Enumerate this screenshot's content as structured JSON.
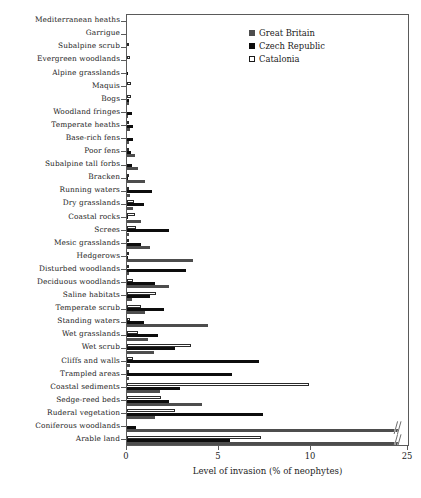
{
  "chart_data": {
    "type": "bar",
    "orientation": "horizontal",
    "title": "",
    "xlabel": "Level of invasion (% of neophytes)",
    "ylabel": "",
    "xlim": [
      0,
      25
    ],
    "xticks": [
      0,
      5,
      10,
      25
    ],
    "xtick_labels": [
      "0",
      "5",
      "10",
      "25"
    ],
    "axis_break": {
      "after": 11.2,
      "resume_at": 24.0,
      "label": "//"
    },
    "grid": false,
    "legend_position": "top-right",
    "categories": [
      "Mediterranean heaths",
      "Garrigue",
      "Subalpine scrub",
      "Evergreen woodlands",
      "Alpine grasslands",
      "Maquis",
      "Bogs",
      "Woodland fringes",
      "Temperate heaths",
      "Base-rich fens",
      "Poor fens",
      "Subalpine tall forbs",
      "Bracken",
      "Running waters",
      "Dry grasslands",
      "Coastal rocks",
      "Screes",
      "Mesic grasslands",
      "Hedgerows",
      "Disturbed woodlands",
      "Deciduous woodlands",
      "Saline habitats",
      "Temperate scrub",
      "Standing waters",
      "Wet grasslands",
      "Wet scrub",
      "Cliffs and walls",
      "Trampled areas",
      "Coastal sediments",
      "Sedge-reed beds",
      "Ruderal vegetation",
      "Coniferous woodlands",
      "Arable land"
    ],
    "series": [
      {
        "name": "Great Britain",
        "color": "#4d4d4d",
        "values": [
          0,
          0,
          0,
          0,
          0,
          0,
          0.1,
          0.05,
          0.15,
          0.1,
          0.45,
          0.6,
          1.0,
          0.15,
          0.35,
          0.75,
          0.1,
          1.25,
          3.6,
          0.1,
          2.3,
          0.25,
          1.0,
          4.4,
          1.15,
          1.45,
          0.15,
          0.1,
          1.8,
          4.1,
          1.5,
          24.0,
          22.6
        ]
      },
      {
        "name": "Czech Republic",
        "color": "#0d0d0d",
        "values": [
          0,
          0,
          0,
          0,
          0.08,
          0,
          0.12,
          0.25,
          0.3,
          0.3,
          0.2,
          0.25,
          0.05,
          1.35,
          0.9,
          0.05,
          2.3,
          0.75,
          0.05,
          3.2,
          1.5,
          1.25,
          2.0,
          0.9,
          1.7,
          2.6,
          7.2,
          5.7,
          2.9,
          2.3,
          7.4,
          0.5,
          5.6
        ]
      },
      {
        "name": "Catalonia",
        "color": "#ffffff",
        "values": [
          0,
          0.02,
          0.03,
          0.18,
          0,
          0.22,
          0.2,
          0,
          0.05,
          0,
          0.05,
          0,
          0.05,
          0.05,
          0.4,
          0.45,
          0.5,
          0.05,
          0.05,
          0.05,
          0.35,
          1.6,
          0.75,
          0.15,
          0.6,
          3.5,
          0.3,
          0.05,
          9.9,
          1.85,
          2.6,
          0,
          7.3
        ]
      }
    ]
  },
  "legend": {
    "items": [
      {
        "label": "Great Britain",
        "swatch": "gb"
      },
      {
        "label": "Czech Republic",
        "swatch": "cz"
      },
      {
        "label": "Catalonia",
        "swatch": "cat"
      }
    ]
  }
}
